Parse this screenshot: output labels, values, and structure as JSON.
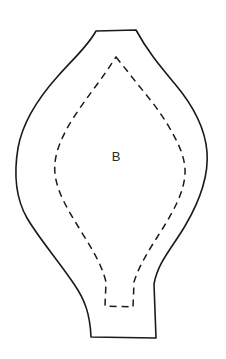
{
  "document": {
    "type": "sewing-pattern-piece",
    "title": "Pattern Piece B",
    "background_color": "#fefefe",
    "ink_color": "#1a1a1a"
  },
  "piece": {
    "label": "B",
    "label_position": {
      "x": 116,
      "y": 158
    },
    "cut_line": {
      "name": "cutting-line",
      "style": "solid",
      "stroke_color": "#1a1a1a",
      "stroke_width": 1.6,
      "path": "M 96 31 L 136 30 C 148 52 160 66 175 84 C 191 103 205 126 207 152 C 209 178 198 204 185 226 C 172 248 158 262 154 284 L 156 338 L 91 337 C 90 314 85 300 74 284 C 58 260 40 240 27 218 C 15 197 14 172 18 148 C 23 120 40 96 58 76 C 74 58 88 46 96 31 Z"
    },
    "seam_line": {
      "name": "seam-allowance-line",
      "style": "dashed",
      "stroke_color": "#1a1a1a",
      "stroke_width": 1.5,
      "dash_pattern": "7 5",
      "path": "M 116 57 L 128 72 C 141 89 155 104 166 122 C 177 140 186 157 185 174 C 184 192 174 210 163 228 C 151 247 139 265 134 282 L 133 307 L 105 306 L 106 282 C 101 262 90 246 79 228 C 68 210 57 192 55 174 C 53 156 61 138 72 120 C 84 101 98 84 108 69 Z"
    }
  },
  "annotations": {
    "label_text": "B"
  }
}
